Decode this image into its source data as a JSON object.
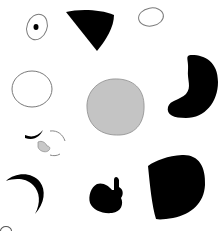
{
  "figure": {
    "background": "#ffffff",
    "shapes": [
      {
        "id": "eye-oval",
        "style": "outline",
        "fill": "none",
        "stroke": "#777777",
        "has_pupil": true,
        "pupil_fill": "#000000"
      },
      {
        "id": "wedge",
        "style": "solid",
        "fill": "#000000"
      },
      {
        "id": "small-oval",
        "style": "outline",
        "fill": "none",
        "stroke": "#777777"
      },
      {
        "id": "large-circle-outline",
        "style": "outline",
        "fill": "none",
        "stroke": "#777777"
      },
      {
        "id": "gray-blob",
        "style": "filled",
        "fill": "#c4c4c4",
        "stroke": "#8a8a8a"
      },
      {
        "id": "kidney",
        "style": "solid",
        "fill": "#000000"
      },
      {
        "id": "face-fragments",
        "style": "mixed",
        "fill": "#000000",
        "stroke": "#888888",
        "accent_fill": "#c8c8c8"
      },
      {
        "id": "crescent",
        "style": "solid",
        "fill": "#000000"
      },
      {
        "id": "knob-blob",
        "style": "solid",
        "fill": "#000000"
      },
      {
        "id": "d-shape",
        "style": "solid",
        "fill": "#000000"
      }
    ]
  },
  "caption": {
    "text": ""
  }
}
